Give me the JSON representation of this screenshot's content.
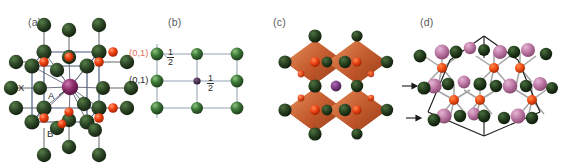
{
  "figure": {
    "kind": "crystal-structure-figure",
    "background": "#ffffff",
    "panel_count": 4
  },
  "palette": {
    "anion_x_green": "#22361f",
    "anion_x_green_light": "#3d5c33",
    "cation_b_red": "#ef3b12",
    "cation_b_red_light": "#ff7c4e",
    "cation_a_purple": "#8e2f6b",
    "cation_a_purple_light": "#c46aa6",
    "pink_sphere": "#c07ba8",
    "pink_sphere_light": "#dba9c8",
    "octahedra_orange": "#c2552b",
    "octahedra_orange_light": "#e08a55",
    "bond_gray": "#8c8c8c",
    "cell_edge_blue": "#3b4a6b",
    "cell_edge_black": "#1a1a1a",
    "grid_line": "#93a2b4",
    "label_gray": "#58585a",
    "label_red": "#e8705a",
    "green_b_sphere": "#3f7a3a",
    "green_b_sphere_light": "#74b06a"
  },
  "panels": {
    "a": {
      "label": "(a)",
      "site_labels": [
        {
          "text": "X",
          "note": "anion site"
        },
        {
          "text": "A",
          "note": "A-site cation, leader line to central purple sphere"
        },
        {
          "text": "B",
          "note": "B-site cation"
        }
      ]
    },
    "b": {
      "label": "(b)",
      "annotations": [
        {
          "text": "(0,1)",
          "color": "#e8705a",
          "position": "top-left-corner"
        },
        {
          "text": "(0,1)",
          "color": "#2a2a2a",
          "position": "mid-left-edge"
        }
      ],
      "fractions": [
        {
          "numerator": "1",
          "denominator": "2",
          "position": "top-left-inside"
        },
        {
          "numerator": "1",
          "denominator": "2",
          "position": "center-next-to-purple-dot"
        }
      ]
    },
    "c": {
      "label": "(c)",
      "description": "corner-sharing octahedra"
    },
    "d": {
      "label": "(d)",
      "arrows": [
        {
          "direction": "right",
          "position": "upper"
        },
        {
          "direction": "right",
          "position": "lower"
        }
      ]
    }
  }
}
